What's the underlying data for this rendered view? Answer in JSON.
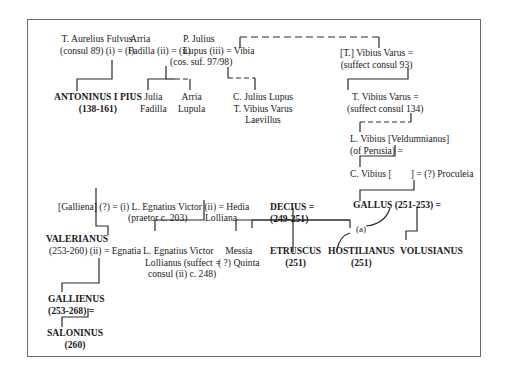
{
  "diagram": {
    "type": "family-tree",
    "title": "",
    "persons": {
      "aurelius_fulvus": [
        "T. Aurelius Fulvus",
        "(consul 89) (i) = (i) "
      ],
      "arria_fadilla": [
        "Arria",
        "Fadilla (ii) = (ii) "
      ],
      "p_julius_lupus": [
        "P. Julius",
        "Lupus (iii) = Vibia",
        "(cos. suf. 97/98)"
      ],
      "antoninus_pius": [
        "ANTONINUS I PIUS",
        "(138-161)"
      ],
      "julia_fadilla": [
        "Julia",
        "Fadilla"
      ],
      "arria_lupula": [
        "Arria",
        "Lupula"
      ],
      "c_julius_lupus": [
        "C. Julius Lupus",
        "T. Vibius Varus",
        "Laevillus"
      ],
      "t_vibius_varus_93": [
        "[T.] Vibius Varus =",
        "(suffect consul 93)"
      ],
      "t_vibius_varus_134": [
        "T. Vibius Varus =",
        "(suffect consul 134)"
      ],
      "l_vibius": [
        "L. Vibius [Veldumnianus]",
        "(of Perusia) ="
      ],
      "c_vibius": [
        "C. Vibius [        ] = (?) Proculeia"
      ],
      "galliena": [
        "[Galliena] (?) = (i) L. Egnatius Victor (ii) = Hedia"
      ],
      "egnatius_praetor": [
        "(praetor c. 203)"
      ],
      "hedia_lolliana": [
        "Lolliana"
      ],
      "valerianus": [
        "VALERIANUS",
        "(253-260) (ii) = Egnatia"
      ],
      "egnatius_lollianus": [
        "L. Egnatius Victor",
        "Lollianus (suffect =",
        "consul (ii) c. 248)"
      ],
      "messia_quinta": [
        "Messia",
        "( ?) Quinta"
      ],
      "decius": [
        "DECIUS =",
        "(249-251)"
      ],
      "etruscus": [
        "ETRUSCUS",
        "(251)"
      ],
      "hostilianus": [
        "HOSTILIANUS",
        "(251)"
      ],
      "gallus": [
        "GALLUS (251-253) ="
      ],
      "volusianus": [
        "VOLUSIANUS"
      ],
      "gallienus": [
        "GALLIENUS",
        "(253-268) ="
      ],
      "saloninus": [
        "SALONINUS",
        "(260)"
      ]
    },
    "annotations": {
      "adoption_mark": "(a)"
    },
    "line_styles": {
      "solid": "#2a2a2a",
      "dashed": "#2a2a2a",
      "frame": "#6b6b6b"
    }
  }
}
